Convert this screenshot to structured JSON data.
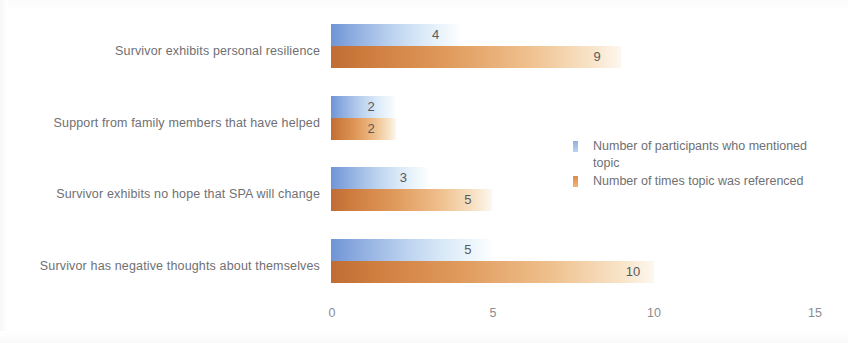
{
  "chart_data": {
    "type": "bar",
    "orientation": "horizontal",
    "title": "",
    "xlabel": "",
    "ylabel": "",
    "xlim": [
      0,
      15
    ],
    "xticks": [
      "0",
      "5",
      "10",
      "15"
    ],
    "grid": false,
    "legend_position": "center-right",
    "categories": [
      "Survivor exhibits personal resilience",
      "Support from family members that have helped",
      "Survivor exhibits no hope that SPA will change",
      "Survivor has negative thoughts about themselves"
    ],
    "series": [
      {
        "name": "Number of participants who mentioned topic",
        "color": "#7a9fdb",
        "values": [
          4,
          2,
          3,
          5
        ]
      },
      {
        "name": "Number of times topic was referenced",
        "color": "#c1713a",
        "values": [
          9,
          2,
          5,
          10
        ]
      }
    ],
    "value_labels": {
      "series_0": [
        "4",
        "2",
        "3",
        "5"
      ],
      "series_1": [
        "9",
        "2",
        "5",
        "10"
      ]
    }
  }
}
